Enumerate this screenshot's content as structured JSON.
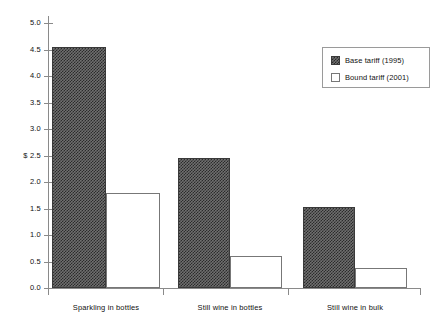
{
  "chart_data": {
    "type": "bar",
    "title": "",
    "subtitle": "",
    "xlabel": "",
    "ylabel": "$",
    "categories": [
      "Sparkling in bottles",
      "Still wine in bottles",
      "Still wine in bulk"
    ],
    "series": [
      {
        "name": "Base tariff (1995)",
        "values": [
          4.55,
          2.45,
          1.53
        ],
        "fill": "hatched",
        "color": "#4a4a4a"
      },
      {
        "name": "Bound tariff (2001)",
        "values": [
          1.8,
          0.6,
          0.38
        ],
        "fill": "open",
        "color": "#ffffff"
      }
    ],
    "ylim": [
      0.0,
      5.0
    ],
    "yticks": [
      0.0,
      0.5,
      1.0,
      1.5,
      2.0,
      2.5,
      3.0,
      3.5,
      4.0,
      4.5,
      5.0
    ],
    "ytick_labels": [
      "0.0",
      "0.5",
      "1.0",
      "1.5",
      "2.0",
      "$ 2.5",
      "3.0",
      "3.5",
      "4.0",
      "4.5",
      "5.0"
    ],
    "grid": false,
    "legend_position": "top-right",
    "legend_entries": [
      "Base tariff (1995)",
      "Bound tariff (2001)"
    ]
  }
}
